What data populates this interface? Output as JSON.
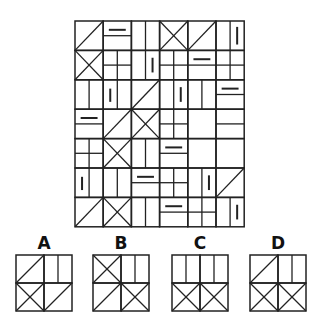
{
  "puzzle": {
    "grid": {
      "x": 75,
      "y": 21,
      "cols": 6,
      "rows": 7,
      "cell_w": 28.2,
      "cell_h": 29.4,
      "stroke": "#222222",
      "cells": [
        [
          "diag",
          "hbar_top",
          "v2",
          "x",
          "diag",
          "vbar_r"
        ],
        [
          "x",
          "grid4",
          "vbar",
          "grid4",
          "hbar_top",
          "grid4"
        ],
        [
          "v2",
          "v2bar",
          "diag",
          "vbar",
          "v2",
          "hbar_top"
        ],
        [
          "hbar_top",
          "diag",
          "x",
          "grid4_b",
          "blank",
          "hsplit"
        ],
        [
          "grid4",
          "x",
          "v2",
          "hbar_top",
          "blank",
          "blank"
        ],
        [
          "v2bar",
          "v2",
          "hbar_top",
          "grid4",
          "vbar",
          "diag"
        ],
        [
          "diag",
          "x",
          "v2",
          "hbar_top",
          "grid4",
          "vbar"
        ]
      ]
    },
    "options": [
      {
        "label": "A",
        "x": 16,
        "y": 255,
        "size": 56,
        "cells": [
          "diag",
          "v2",
          "x",
          "diag"
        ]
      },
      {
        "label": "B",
        "x": 93,
        "y": 255,
        "size": 56,
        "cells": [
          "x",
          "v2",
          "diag",
          "x"
        ]
      },
      {
        "label": "C",
        "x": 172,
        "y": 255,
        "size": 56,
        "cells": [
          "v2",
          "v2",
          "x",
          "x"
        ]
      },
      {
        "label": "D",
        "x": 250,
        "y": 255,
        "size": 56,
        "cells": [
          "diag",
          "v2",
          "x",
          "x"
        ]
      }
    ]
  }
}
